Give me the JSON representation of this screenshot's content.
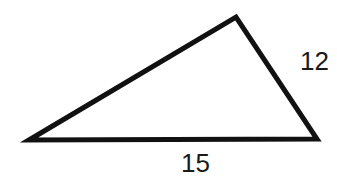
{
  "diagram": {
    "type": "triangle",
    "stroke_color": "#111111",
    "fill_color": "#ffffff",
    "stroke_width": 5,
    "vertices": {
      "left": {
        "x": 29,
        "y": 140
      },
      "top": {
        "x": 236,
        "y": 17
      },
      "right": {
        "x": 317,
        "y": 139
      }
    },
    "labels": {
      "right_side": "12",
      "bottom_side": "15"
    }
  }
}
